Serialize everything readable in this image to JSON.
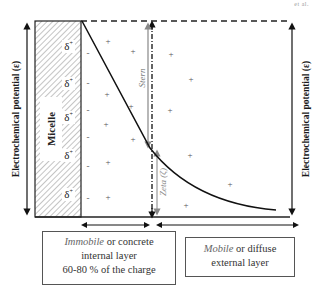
{
  "corner_label": "et al.",
  "axis": {
    "left_label": "Electrochemical potential (ε)",
    "right_label": "Electrochemical potential (ε)"
  },
  "micelle": {
    "label": "Micelle",
    "surface_charges": [
      "δ+",
      "δ+",
      "δ+",
      "δ+",
      "δ+"
    ]
  },
  "layers": {
    "stern_label": "Stern",
    "zeta_label": "Zeta (ζ)"
  },
  "ions": {
    "minus_sign": "-",
    "plus_sign": "+",
    "minus_positions": [
      [
        88,
        53
      ],
      [
        88,
        83
      ],
      [
        88,
        110
      ],
      [
        88,
        137
      ],
      [
        88,
        166
      ],
      [
        88,
        198
      ]
    ],
    "plus_positions": [
      [
        108,
        41
      ],
      [
        133,
        51
      ],
      [
        107,
        94
      ],
      [
        106,
        124
      ],
      [
        131,
        106
      ],
      [
        108,
        162
      ],
      [
        108,
        197
      ],
      [
        133,
        139
      ],
      [
        171,
        54
      ],
      [
        191,
        79
      ],
      [
        170,
        110
      ],
      [
        190,
        155
      ],
      [
        230,
        184
      ],
      [
        186,
        205
      ]
    ]
  },
  "boxes": {
    "immobile": {
      "emphasis": "Immobile",
      "rest_line1": " or concrete",
      "line2": "internal layer",
      "line3": "60-80 % of the charge"
    },
    "mobile": {
      "emphasis": "Mobile",
      "rest_line1": " or diffuse",
      "line2": "external layer"
    }
  }
}
